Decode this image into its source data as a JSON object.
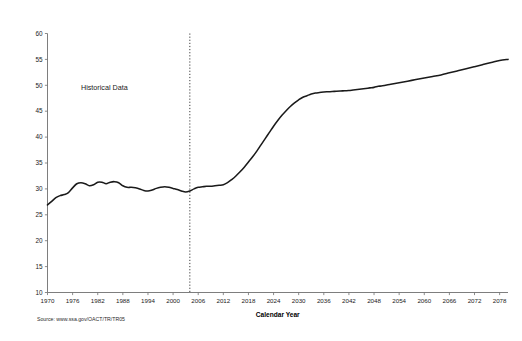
{
  "chart_data": {
    "type": "line",
    "title": "",
    "xlabel": "Calendar Year",
    "ylabel": "",
    "xlim": [
      1970,
      2080
    ],
    "ylim": [
      10,
      60
    ],
    "grid": false,
    "legend": "none",
    "xticks": [
      1970,
      1976,
      1982,
      1988,
      1994,
      2000,
      2006,
      2012,
      2018,
      2024,
      2030,
      2036,
      2042,
      2048,
      2054,
      2060,
      2066,
      2072,
      2078
    ],
    "yticks": [
      10,
      15,
      20,
      25,
      30,
      35,
      40,
      45,
      50,
      55,
      60
    ],
    "annotations": [
      {
        "text": "Historical Data",
        "x": 1978,
        "y": 49
      }
    ],
    "divider": {
      "x": 2004,
      "style": "dotted",
      "label": "historical-projection boundary"
    },
    "source": "Source: www.ssa.gov/OACT/TR/TR05",
    "series": [
      {
        "name": "Beneficiaries per 100 covered workers",
        "color": "#1a1a1a",
        "x": [
          1970,
          1971,
          1972,
          1973,
          1974,
          1975,
          1976,
          1977,
          1978,
          1979,
          1980,
          1981,
          1982,
          1983,
          1984,
          1985,
          1986,
          1987,
          1988,
          1989,
          1990,
          1991,
          1992,
          1993,
          1994,
          1995,
          1996,
          1997,
          1998,
          1999,
          2000,
          2001,
          2002,
          2003,
          2004,
          2005,
          2006,
          2007,
          2008,
          2009,
          2010,
          2011,
          2012,
          2013,
          2014,
          2015,
          2016,
          2017,
          2018,
          2019,
          2020,
          2021,
          2022,
          2023,
          2024,
          2025,
          2026,
          2027,
          2028,
          2029,
          2030,
          2031,
          2032,
          2033,
          2034,
          2035,
          2036,
          2037,
          2038,
          2039,
          2040,
          2041,
          2042,
          2043,
          2044,
          2045,
          2046,
          2047,
          2048,
          2049,
          2050,
          2052,
          2054,
          2056,
          2058,
          2060,
          2062,
          2064,
          2066,
          2068,
          2070,
          2072,
          2074,
          2076,
          2078,
          2080
        ],
        "y": [
          26.9,
          27.6,
          28.3,
          28.7,
          28.9,
          29.3,
          30.2,
          31.0,
          31.2,
          31.0,
          30.6,
          30.8,
          31.3,
          31.3,
          31.0,
          31.3,
          31.4,
          31.2,
          30.6,
          30.3,
          30.3,
          30.2,
          30.0,
          29.7,
          29.6,
          29.8,
          30.1,
          30.3,
          30.4,
          30.3,
          30.1,
          29.9,
          29.6,
          29.4,
          29.6,
          30.0,
          30.3,
          30.4,
          30.5,
          30.5,
          30.6,
          30.7,
          30.8,
          31.2,
          31.8,
          32.5,
          33.3,
          34.2,
          35.2,
          36.2,
          37.3,
          38.5,
          39.7,
          40.9,
          42.1,
          43.2,
          44.2,
          45.1,
          45.9,
          46.6,
          47.2,
          47.7,
          48.0,
          48.3,
          48.5,
          48.6,
          48.7,
          48.75,
          48.8,
          48.85,
          48.9,
          48.95,
          49.0,
          49.1,
          49.2,
          49.3,
          49.4,
          49.5,
          49.6,
          49.8,
          49.9,
          50.2,
          50.5,
          50.8,
          51.1,
          51.4,
          51.7,
          52.0,
          52.4,
          52.8,
          53.2,
          53.6,
          54.0,
          54.4,
          54.8,
          55.0
        ]
      }
    ]
  },
  "labels": {
    "annotation_historical": "Historical Data",
    "axis_x_title": "Calendar Year",
    "source": "Source: www.ssa.gov/OACT/TR/TR05"
  }
}
